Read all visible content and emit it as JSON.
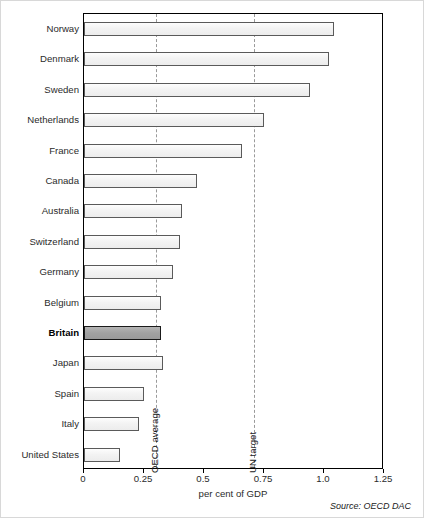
{
  "chart_data": {
    "type": "bar",
    "orientation": "horizontal",
    "title": "",
    "xlabel": "per cent of GDP",
    "ylabel": "",
    "xlim": [
      0,
      1.25
    ],
    "xticks": [
      0,
      0.25,
      0.5,
      0.75,
      1.0,
      1.25
    ],
    "xticklabels": [
      "0",
      "0.25",
      "0.5",
      "0.75",
      "1.0",
      "1.25"
    ],
    "grid": false,
    "legend": "none",
    "categories": [
      "Norway",
      "Denmark",
      "Sweden",
      "Netherlands",
      "France",
      "Canada",
      "Australia",
      "Switzerland",
      "Germany",
      "Belgium",
      "Britain",
      "Japan",
      "Spain",
      "Italy",
      "United States"
    ],
    "values": [
      1.04,
      1.02,
      0.94,
      0.75,
      0.66,
      0.47,
      0.41,
      0.4,
      0.37,
      0.32,
      0.32,
      0.33,
      0.25,
      0.23,
      0.15
    ],
    "highlight_category": "Britain",
    "annotations": [
      {
        "label": "OECD average",
        "value": 0.3,
        "style": "dashed-vertical"
      },
      {
        "label": "UN target",
        "value": 0.71,
        "style": "dashed-vertical"
      }
    ],
    "source": "Source: OECD DAC"
  },
  "colors": {
    "bar_fill": "#f2f2f2",
    "bar_stroke": "#5a5a5a",
    "highlight_fill": "#a2a2a2",
    "highlight_stroke": "#1a1a1a",
    "axis": "#000000",
    "reference_line": "#9a9a9a",
    "text": "#2b2b2b",
    "frame": "#d8d8d8"
  }
}
